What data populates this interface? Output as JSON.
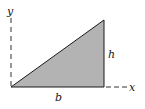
{
  "diagram": {
    "labels": {
      "y_axis": "y",
      "x_axis": "x",
      "height": "h",
      "base": "b"
    },
    "colors": {
      "fill": "#b3b3b3",
      "stroke": "#1a1a1a",
      "background": "#ffffff"
    },
    "shapes": {
      "triangle": {
        "vertices": [
          [
            11,
            87
          ],
          [
            104,
            87
          ],
          [
            104,
            20
          ]
        ],
        "fill": "#b3b3b3"
      }
    }
  }
}
